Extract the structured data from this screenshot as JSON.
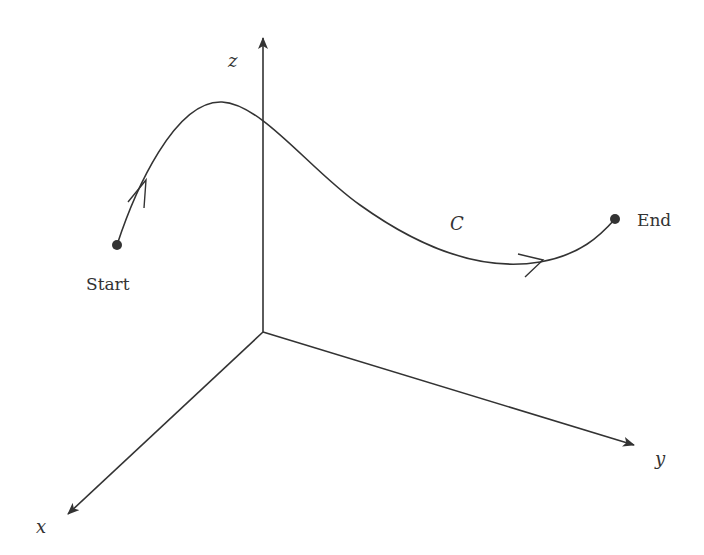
{
  "diagram": {
    "type": "3d-coordinate-path",
    "colors": {
      "line": "#333333",
      "background": "#ffffff"
    },
    "axes": {
      "origin": [
        263,
        332
      ],
      "z": {
        "label": "z",
        "tip": [
          263,
          36
        ],
        "label_pos": [
          233,
          62
        ]
      },
      "y": {
        "label": "y",
        "tip": [
          636,
          446
        ],
        "label_pos": [
          662,
          460
        ]
      },
      "x": {
        "label": "x",
        "tip": [
          66,
          515
        ],
        "label_pos": [
          40,
          528
        ]
      }
    },
    "curve": {
      "label": "C",
      "label_pos": [
        455,
        225
      ],
      "path": "M117,245 C135,190 175,100 222,102 C262,104 310,170 360,205 C420,248 480,272 540,262 C580,255 600,236 615,219"
    },
    "points": {
      "start": {
        "label": "Start",
        "pos": [
          117,
          245
        ],
        "label_pos": [
          86,
          285
        ]
      },
      "end": {
        "label": "End",
        "pos": [
          615,
          219
        ],
        "label_pos": [
          637,
          225
        ]
      }
    },
    "arrows": [
      {
        "name": "direction-arrow-1",
        "at": [
          146,
          180
        ]
      },
      {
        "name": "direction-arrow-2",
        "at": [
          540,
          262
        ]
      }
    ]
  }
}
